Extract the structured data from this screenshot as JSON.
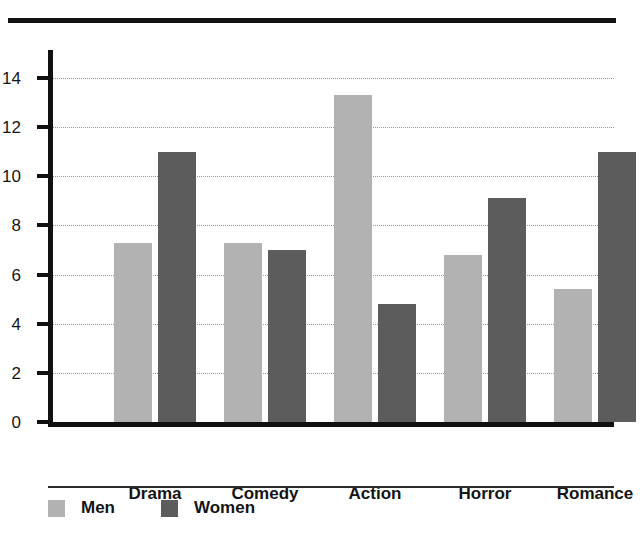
{
  "chart_data": {
    "type": "bar",
    "title": "",
    "xlabel": "",
    "ylabel": "",
    "categories": [
      "Drama",
      "Comedy",
      "Action",
      "Horror",
      "Romance"
    ],
    "series": [
      {
        "name": "Men",
        "color": "#b2b2b2",
        "values": [
          7.3,
          7.3,
          13.3,
          6.8,
          5.4
        ]
      },
      {
        "name": "Women",
        "color": "#5c5c5c",
        "values": [
          11.0,
          7.0,
          4.8,
          9.1,
          11.0
        ]
      }
    ],
    "ylim": [
      0,
      14
    ],
    "ytick_labels": [
      "0",
      "2",
      "4",
      "6",
      "8",
      "10",
      "12",
      "14"
    ],
    "ytick_values": [
      0,
      2,
      4,
      6,
      8,
      10,
      12,
      14
    ],
    "grid": "horizontal-dotted",
    "legend_position": "bottom-left",
    "bar_mode": "grouped"
  },
  "legend": {
    "items": [
      {
        "label": "Men",
        "color": "#b2b2b2"
      },
      {
        "label": "Women",
        "color": "#5c5c5c"
      }
    ]
  },
  "colors": {
    "men": "#b2b2b2",
    "women": "#5c5c5c",
    "axis": "#111111",
    "gridline": "#9a9a9a",
    "background": "#ffffff"
  }
}
